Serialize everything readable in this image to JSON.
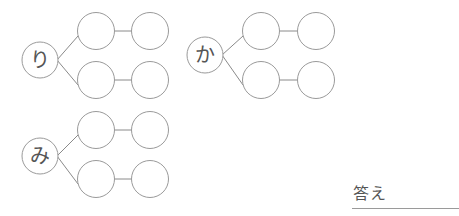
{
  "worksheet": {
    "groups": [
      {
        "root": "り",
        "cx": 40,
        "cy": 60,
        "rows": [
          31,
          80
        ],
        "cols": [
          96,
          150
        ]
      },
      {
        "root": "か",
        "cx": 205,
        "cy": 55,
        "rows": [
          31,
          80
        ],
        "cols": [
          261,
          316
        ]
      },
      {
        "root": "み",
        "cx": 40,
        "cy": 156,
        "rows": [
          130,
          179
        ],
        "cols": [
          96,
          150
        ]
      }
    ],
    "answer_label": "答え",
    "answer_value": ""
  }
}
